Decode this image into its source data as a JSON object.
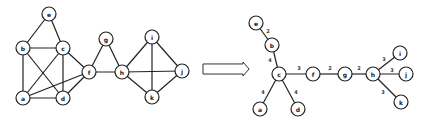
{
  "diagram": {
    "type": "graph-to-spanning-tree",
    "colors": {
      "stroke": "#222222",
      "node_fill": "#ffffff",
      "background": "#ffffff"
    },
    "node_radius": 7,
    "left_graph": {
      "name": "original-graph",
      "nodes": [
        {
          "id": "e",
          "label": "e",
          "x": 49,
          "y": 14
        },
        {
          "id": "b",
          "label": "b",
          "x": 23,
          "y": 48
        },
        {
          "id": "c",
          "label": "c",
          "x": 63,
          "y": 48
        },
        {
          "id": "a",
          "label": "a",
          "x": 23,
          "y": 98
        },
        {
          "id": "d",
          "label": "d",
          "x": 63,
          "y": 98
        },
        {
          "id": "f",
          "label": "f",
          "x": 89,
          "y": 72
        },
        {
          "id": "g",
          "label": "g",
          "x": 106,
          "y": 39
        },
        {
          "id": "h",
          "label": "h",
          "x": 122,
          "y": 72
        },
        {
          "id": "i",
          "label": "i",
          "x": 152,
          "y": 37
        },
        {
          "id": "j",
          "label": "j",
          "x": 182,
          "y": 71
        },
        {
          "id": "k",
          "label": "k",
          "x": 152,
          "y": 97
        }
      ],
      "edges": [
        [
          "e",
          "b"
        ],
        [
          "e",
          "c"
        ],
        [
          "b",
          "c"
        ],
        [
          "b",
          "a"
        ],
        [
          "b",
          "d"
        ],
        [
          "c",
          "a"
        ],
        [
          "c",
          "d"
        ],
        [
          "c",
          "f"
        ],
        [
          "a",
          "d"
        ],
        [
          "a",
          "f"
        ],
        [
          "d",
          "f"
        ],
        [
          "f",
          "g"
        ],
        [
          "f",
          "h"
        ],
        [
          "g",
          "h"
        ],
        [
          "h",
          "i"
        ],
        [
          "h",
          "j"
        ],
        [
          "h",
          "k"
        ],
        [
          "i",
          "k"
        ],
        [
          "i",
          "j"
        ],
        [
          "j",
          "k"
        ]
      ]
    },
    "arrow": {
      "label": "transforms-to",
      "x": 203,
      "y": 62,
      "width": 46,
      "height": 14
    },
    "right_graph": {
      "name": "spanning-tree",
      "nodes": [
        {
          "id": "e",
          "label": "e",
          "x": 256,
          "y": 23
        },
        {
          "id": "b",
          "label": "b",
          "x": 272,
          "y": 45
        },
        {
          "id": "c",
          "label": "c",
          "x": 279,
          "y": 74
        },
        {
          "id": "a",
          "label": "a",
          "x": 260,
          "y": 109
        },
        {
          "id": "d",
          "label": "d",
          "x": 298,
          "y": 109
        },
        {
          "id": "f",
          "label": "f",
          "x": 313,
          "y": 74
        },
        {
          "id": "g",
          "label": "g",
          "x": 345,
          "y": 74
        },
        {
          "id": "h",
          "label": "h",
          "x": 373,
          "y": 74
        },
        {
          "id": "i",
          "label": "i",
          "x": 400,
          "y": 53
        },
        {
          "id": "j",
          "label": "j",
          "x": 406,
          "y": 74
        },
        {
          "id": "k",
          "label": "k",
          "x": 401,
          "y": 102
        }
      ],
      "edges": [
        {
          "from": "e",
          "to": "b",
          "weight": "2",
          "lx": 268,
          "ly": 31
        },
        {
          "from": "b",
          "to": "c",
          "weight": "4",
          "lx": 270,
          "ly": 60
        },
        {
          "from": "c",
          "to": "a",
          "weight": "4",
          "lx": 263,
          "ly": 92
        },
        {
          "from": "c",
          "to": "d",
          "weight": "4",
          "lx": 296,
          "ly": 92
        },
        {
          "from": "c",
          "to": "f",
          "weight": "3",
          "lx": 299,
          "ly": 68
        },
        {
          "from": "f",
          "to": "g",
          "weight": "2",
          "lx": 330,
          "ly": 68
        },
        {
          "from": "g",
          "to": "h",
          "weight": "2",
          "lx": 359,
          "ly": 68
        },
        {
          "from": "h",
          "to": "i",
          "weight": "3",
          "lx": 384,
          "ly": 59
        },
        {
          "from": "h",
          "to": "j",
          "weight": "3",
          "lx": 392,
          "ly": 70
        },
        {
          "from": "h",
          "to": "k",
          "weight": "3",
          "lx": 383,
          "ly": 92
        }
      ]
    }
  }
}
